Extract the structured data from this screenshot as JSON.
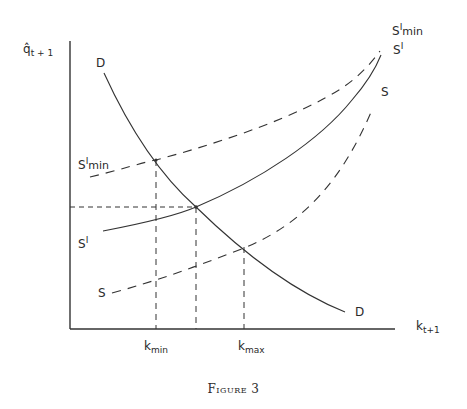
{
  "figure": {
    "caption": "Figure 3",
    "y_axis_label": "q̂",
    "y_axis_sub": "t + 1",
    "x_axis_label": "k",
    "x_axis_sub": "t+1",
    "x_ticks": [
      {
        "label": "k",
        "sub": "min"
      },
      {
        "label": "k",
        "sub": "max"
      }
    ],
    "curves": {
      "D_top": "D",
      "D_bottom": "D",
      "S_prime_min_left": "S",
      "S_prime_min_left_sup": "I",
      "S_prime_min_left_sub": "min",
      "S_prime_min_right": "S",
      "S_prime_min_right_sup": "I",
      "S_prime_min_right_sub": "min",
      "S_prime_left": "S",
      "S_prime_left_sup": "I",
      "S_prime_right": "S",
      "S_prime_right_sup": "I",
      "S_left": "S",
      "S_right": "S"
    }
  }
}
